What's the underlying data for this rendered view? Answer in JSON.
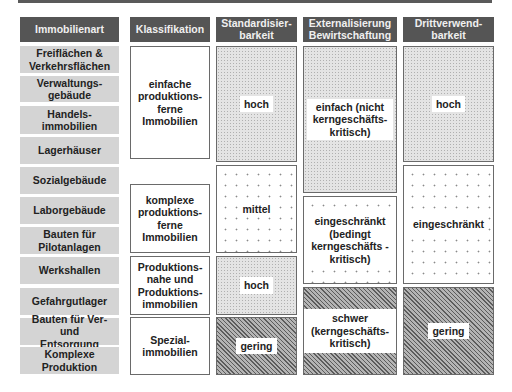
{
  "headers": {
    "immobilienart": "Immobilienart",
    "klassifikation": "Klassifikation",
    "standardisierbarkeit": "Standardisier-\nbarkeit",
    "externalisierung": "Externalisierung\nBewirtschaftung",
    "drittverwendbarkeit": "Drittverwend-\nbarkeit"
  },
  "immobilienarten": [
    "Freiflächen & Verkehrsflächen",
    "Verwaltungs-gebäude",
    "Handels-immobilien",
    "Lagerhäuser",
    "Sozialgebäude",
    "Laborgebäude",
    "Bauten für Pilotanlagen",
    "Werkshallen",
    "Gefahrgutlager",
    "Bauten für Ver- und Entsorgung",
    "Komplexe Produktion"
  ],
  "klassifikation": [
    "einfache produktions-ferne Immobilien",
    "komplexe produktions-ferne Immobilien",
    "Produktions-nahe und Produktions-immobilien",
    "Spezial-immobilien"
  ],
  "standardisierbarkeit": [
    "hoch",
    "mittel",
    "hoch",
    "gering"
  ],
  "externalisierung": [
    "einfach (nicht kerngeschäfts-kritisch)",
    "eingeschränkt (bedingt kerngeschäfts -kritisch)",
    "schwer (kerngeschäfts-kritisch)"
  ],
  "drittverwendbarkeit": [
    "hoch",
    "eingeschränkt",
    "gering"
  ],
  "colors": {
    "header_bg": "#555555",
    "category_bg": "#d4d4d4",
    "border": "#6a6a6a"
  }
}
